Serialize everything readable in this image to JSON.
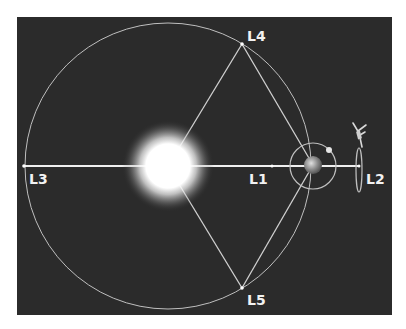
{
  "diagram": {
    "type": "lagrange-points",
    "background_color": "#2b2b2b",
    "line_color": "#d9d9d9",
    "sun": {
      "cx": 168,
      "cy": 166,
      "core_r": 24,
      "glow_r": 46
    },
    "earth": {
      "cx": 313,
      "cy": 165,
      "r": 9
    },
    "moon_orbit": {
      "cx": 313,
      "cy": 166,
      "r": 23
    },
    "moon": {
      "cx": 329,
      "cy": 150,
      "r": 3
    },
    "earth_orbit": {
      "cx": 168,
      "cy": 166,
      "r": 143
    },
    "halo_orbit": {
      "cx": 359,
      "cy": 170,
      "rx": 3,
      "ry": 22
    },
    "points": [
      {
        "id": "L1",
        "label": "L1",
        "x": 272,
        "y": 166
      },
      {
        "id": "L2",
        "label": "L2",
        "x": 359,
        "y": 166
      },
      {
        "id": "L3",
        "label": "L3",
        "x": 24,
        "y": 166
      },
      {
        "id": "L4",
        "label": "L4",
        "x": 242,
        "y": 44
      },
      {
        "id": "L5",
        "label": "L5",
        "x": 242,
        "y": 288
      }
    ],
    "labels": {
      "L1": "L1",
      "L2": "L2",
      "L3": "L3",
      "L4": "L4",
      "L5": "L5"
    }
  }
}
